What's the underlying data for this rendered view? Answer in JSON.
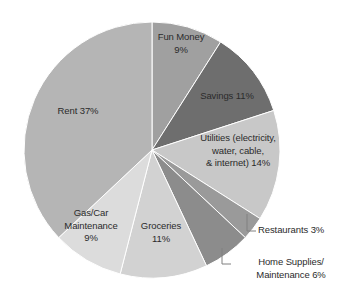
{
  "chart_data": {
    "type": "pie",
    "title": "",
    "subtitle": "",
    "xlabel": "",
    "ylabel": "",
    "legend_position": "none",
    "grid": false,
    "labels_inside": true,
    "start_angle_deg": 0,
    "direction": "clockwise",
    "categories": [
      "Fun Money",
      "Savings",
      "Utilities (electricity, water, cable, & internet)",
      "Restaurants",
      "Home Supplies/ Maintenance",
      "Groceries",
      "Gas/Car Maintenance",
      "Rent"
    ],
    "values": [
      9,
      11,
      14,
      3,
      6,
      11,
      9,
      37
    ],
    "value_unit": "%",
    "total": 100,
    "colors": [
      "#a0a0a0",
      "#6e6e6e",
      "#c8c8c8",
      "#9a9a9a",
      "#8c8c8c",
      "#d2d2d2",
      "#dcdcdc",
      "#b5b5b5"
    ],
    "slice_border_color": "#ffffff",
    "label_color": "#2b2b2b",
    "background": "#ffffff",
    "slices": [
      {
        "name": "Fun Money",
        "value": 9,
        "label": "Fun Money\n9%",
        "color": "#a0a0a0",
        "label_placement": "inside"
      },
      {
        "name": "Savings",
        "value": 11,
        "label": "Savings 11%",
        "color": "#6e6e6e",
        "label_placement": "inside"
      },
      {
        "name": "Utilities (electricity, water, cable, & internet)",
        "value": 14,
        "label": "Utilities (electricity,\nwater, cable,\n& internet) 14%",
        "color": "#c8c8c8",
        "label_placement": "inside"
      },
      {
        "name": "Restaurants",
        "value": 3,
        "label": "Restaurants 3%",
        "color": "#9a9a9a",
        "label_placement": "callout"
      },
      {
        "name": "Home Supplies/ Maintenance",
        "value": 6,
        "label": "Home Supplies/\nMaintenance 6%",
        "color": "#8c8c8c",
        "label_placement": "callout"
      },
      {
        "name": "Groceries",
        "value": 11,
        "label": "Groceries\n11%",
        "color": "#d2d2d2",
        "label_placement": "inside"
      },
      {
        "name": "Gas/Car Maintenance",
        "value": 9,
        "label": "Gas/Car\nMaintenance\n9%",
        "color": "#dcdcdc",
        "label_placement": "inside"
      },
      {
        "name": "Rent",
        "value": 37,
        "label": "Rent 37%",
        "color": "#b5b5b5",
        "label_placement": "inside"
      }
    ],
    "geometry": {
      "center_x": 152,
      "center_y": 150,
      "radius": 128
    }
  }
}
